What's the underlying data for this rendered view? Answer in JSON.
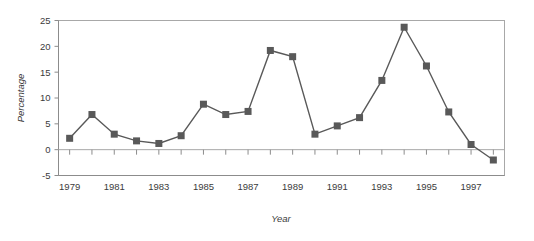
{
  "chart_data": {
    "type": "line",
    "title": "",
    "xlabel": "Year",
    "ylabel": "Percentage",
    "x": [
      1979,
      1980,
      1981,
      1982,
      1983,
      1984,
      1985,
      1986,
      1987,
      1988,
      1989,
      1990,
      1991,
      1992,
      1993,
      1994,
      1995,
      1996,
      1997,
      1998
    ],
    "values": [
      2.2,
      6.8,
      3.0,
      1.7,
      1.2,
      2.7,
      8.8,
      6.8,
      7.4,
      19.2,
      18.0,
      3.0,
      4.6,
      6.2,
      13.4,
      23.7,
      16.2,
      7.3,
      1.0,
      -2.0
    ],
    "series": [
      {
        "name": "Percentage",
        "values": [
          2.2,
          6.8,
          3.0,
          1.7,
          1.2,
          2.7,
          8.8,
          6.8,
          7.4,
          19.2,
          18.0,
          3.0,
          4.6,
          6.2,
          13.4,
          23.7,
          16.2,
          7.3,
          1.0,
          -2.0
        ]
      }
    ],
    "xlim": [
      1978.5,
      1998.5
    ],
    "ylim": [
      -5,
      25
    ],
    "y_ticks": [
      -5,
      0,
      5,
      10,
      15,
      20,
      25
    ],
    "y_tick_labels": [
      "-5",
      "0",
      "5",
      "10",
      "15",
      "20",
      "25"
    ],
    "x_ticks": [
      1979,
      1980,
      1981,
      1982,
      1983,
      1984,
      1985,
      1986,
      1987,
      1988,
      1989,
      1990,
      1991,
      1992,
      1993,
      1994,
      1995,
      1996,
      1997,
      1998
    ],
    "x_tick_labels": [
      "1979",
      "",
      "1981",
      "",
      "1983",
      "",
      "1985",
      "",
      "1987",
      "",
      "1989",
      "",
      "1991",
      "",
      "1993",
      "",
      "1995",
      "",
      "1997",
      ""
    ],
    "x_labeled_ticks": [
      1979,
      1981,
      1983,
      1985,
      1987,
      1989,
      1991,
      1993,
      1995,
      1997
    ],
    "grid": false,
    "legend": false,
    "legend_position": "none",
    "marker": "square",
    "colors": {
      "series": "#595959",
      "axis": "#8c8c8c",
      "border": "#a8a8a8",
      "zero_line": "#a8a8a8",
      "text": "#3b3b3b",
      "background": "#ffffff"
    }
  }
}
